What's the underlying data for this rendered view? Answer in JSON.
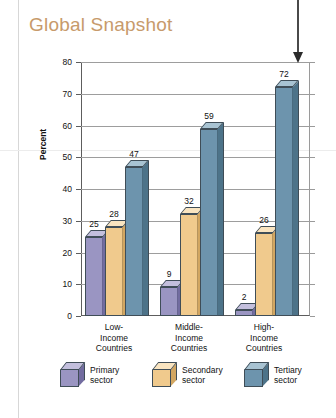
{
  "title": "Global Snapshot",
  "chart_data": {
    "type": "bar",
    "title": "Global Snapshot",
    "xlabel": "",
    "ylabel": "Percent",
    "ylim": [
      0,
      80
    ],
    "yticks": [
      0,
      10,
      20,
      30,
      40,
      50,
      60,
      70,
      80
    ],
    "grid": true,
    "legend_position": "bottom",
    "categories": [
      "Low-\nIncome\nCountries",
      "Middle-\nIncome\nCountries",
      "High-\nIncome\nCountries"
    ],
    "series": [
      {
        "name": "Primary sector",
        "color": "#9a95c2",
        "values": [
          25,
          9,
          2
        ]
      },
      {
        "name": "Secondary sector",
        "color": "#f0ca8d",
        "values": [
          28,
          32,
          26
        ]
      },
      {
        "name": "Tertiary sector",
        "color": "#6d94ad",
        "values": [
          47,
          59,
          72
        ]
      }
    ],
    "annotations": [
      {
        "type": "arrow",
        "points_to": "High-Income Countries / Tertiary sector",
        "value": 72
      }
    ]
  },
  "axis": {
    "y_title": "Percent",
    "y_ticks": [
      "80",
      "70",
      "60",
      "50",
      "40",
      "30",
      "20",
      "10",
      "0"
    ]
  },
  "groups": [
    {
      "label_lines": [
        "Low-",
        "Income",
        "Countries"
      ],
      "bars": [
        {
          "series": "Primary sector",
          "value": "25"
        },
        {
          "series": "Secondary sector",
          "value": "28"
        },
        {
          "series": "Tertiary sector",
          "value": "47"
        }
      ]
    },
    {
      "label_lines": [
        "Middle-",
        "Income",
        "Countries"
      ],
      "bars": [
        {
          "series": "Primary sector",
          "value": "9"
        },
        {
          "series": "Secondary sector",
          "value": "32"
        },
        {
          "series": "Tertiary sector",
          "value": "59"
        }
      ]
    },
    {
      "label_lines": [
        "High-",
        "Income",
        "Countries"
      ],
      "bars": [
        {
          "series": "Primary sector",
          "value": "2"
        },
        {
          "series": "Secondary sector",
          "value": "26"
        },
        {
          "series": "Tertiary sector",
          "value": "72"
        }
      ]
    }
  ],
  "legend": [
    {
      "line1": "Primary",
      "line2": "sector"
    },
    {
      "line1": "Secondary",
      "line2": "sector"
    },
    {
      "line1": "Tertiary",
      "line2": "sector"
    }
  ],
  "colors": {
    "title": "#c79a6b",
    "primary_sector": "#9a95c2",
    "secondary_sector": "#f0ca8d",
    "tertiary_sector": "#6d94ad"
  }
}
